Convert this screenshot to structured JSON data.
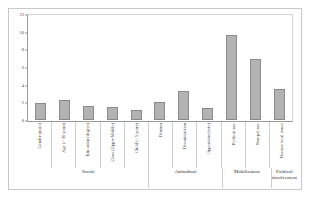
{
  "chart_data": {
    "type": "bar",
    "title": "",
    "xlabel": "",
    "ylabel": "",
    "ylim": [
      0,
      12
    ],
    "yticks": [
      0,
      2,
      4,
      6,
      8,
      10,
      12
    ],
    "grid": false,
    "legend": "none",
    "categories": [
      "Gender (male)",
      "Age (> 30 years)",
      "Education (degree)",
      "Class (Upper-Middle)",
      "Child (< 5 years)",
      "Distrust",
      "Dissatisfaction",
      "Opposition (vote)",
      "Political ass.",
      "Non-pol ass.",
      "Discuss local issues"
    ],
    "values": [
      2.0,
      2.3,
      1.6,
      1.5,
      1.2,
      2.1,
      3.3,
      1.4,
      9.7,
      7.0,
      3.6
    ],
    "groups": [
      {
        "label": "Social",
        "count": 5
      },
      {
        "label": "Attitudinal",
        "count": 3
      },
      {
        "label": "Mobilization",
        "count": 2
      },
      {
        "label": "Political\ninvolvement",
        "count": 1
      }
    ],
    "bar_color": "#b3b3b3",
    "bar_border_color": "#8a8a8a",
    "axis_color": "#9a9a9a",
    "frame_color": "#c8c8c8"
  }
}
